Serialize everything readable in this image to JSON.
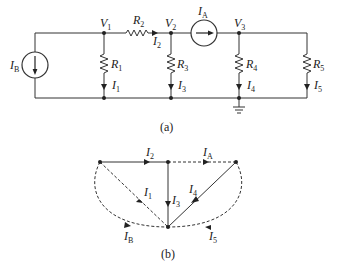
{
  "figure_a": {
    "caption": "(a)",
    "nodes": {
      "v1": "V",
      "v1_sub": "1",
      "v2": "V",
      "v2_sub": "2",
      "v3": "V",
      "v3_sub": "3"
    },
    "sources": {
      "ib": "I",
      "ib_sub": "B",
      "ia": "I",
      "ia_sub": "A"
    },
    "resistors": {
      "r1": "R",
      "r1_sub": "1",
      "r2": "R",
      "r2_sub": "2",
      "r3": "R",
      "r3_sub": "3",
      "r4": "R",
      "r4_sub": "4",
      "r5": "R",
      "r5_sub": "5"
    },
    "currents": {
      "i1": "I",
      "i1_sub": "1",
      "i2": "I",
      "i2_sub": "2",
      "i3": "I",
      "i3_sub": "3",
      "i4": "I",
      "i4_sub": "4",
      "i5": "I",
      "i5_sub": "5"
    }
  },
  "figure_b": {
    "caption": "(b)",
    "edges": {
      "i1": "I",
      "i1_sub": "1",
      "i2": "I",
      "i2_sub": "2",
      "i3": "I",
      "i3_sub": "3",
      "i4": "I",
      "i4_sub": "4",
      "i5": "I",
      "i5_sub": "5",
      "ia": "I",
      "ia_sub": "A",
      "ib": "I",
      "ib_sub": "B"
    }
  }
}
